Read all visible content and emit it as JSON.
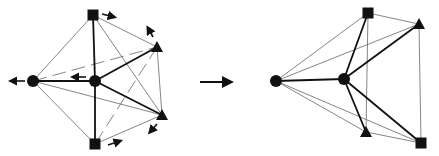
{
  "diagram": {
    "colors": {
      "ink": "#111111",
      "thin_edge": "#777777",
      "background": "#ffffff"
    },
    "left_graph": {
      "nodes": [
        {
          "id": "sq_top",
          "shape": "square",
          "x": 93,
          "y": 15
        },
        {
          "id": "tri_right",
          "shape": "triangle",
          "x": 157,
          "y": 47
        },
        {
          "id": "circle_left",
          "shape": "circle",
          "x": 33,
          "y": 81
        },
        {
          "id": "circle_center",
          "shape": "circle",
          "x": 95,
          "y": 81
        },
        {
          "id": "tri_bottom",
          "shape": "triangle",
          "x": 162,
          "y": 115
        },
        {
          "id": "sq_bottom",
          "shape": "square",
          "x": 95,
          "y": 144
        }
      ],
      "motion_arrows": [
        {
          "x1": 102,
          "y1": 14,
          "x2": 114,
          "y2": 17
        },
        {
          "x1": 153,
          "y1": 37,
          "x2": 148,
          "y2": 28
        },
        {
          "x1": 25,
          "y1": 81,
          "x2": 11,
          "y2": 81
        },
        {
          "x1": 86,
          "y1": 77,
          "x2": 73,
          "y2": 77
        },
        {
          "x1": 157,
          "y1": 124,
          "x2": 150,
          "y2": 132
        },
        {
          "x1": 108,
          "y1": 145,
          "x2": 120,
          "y2": 141
        }
      ]
    },
    "transition_arrow": {
      "x1": 200,
      "y1": 82,
      "x2": 234,
      "y2": 82
    },
    "right_graph": {
      "nodes": [
        {
          "id": "sq_top",
          "shape": "square",
          "x": 368,
          "y": 13
        },
        {
          "id": "tri_right",
          "shape": "triangle",
          "x": 419,
          "y": 24
        },
        {
          "id": "circle_left",
          "shape": "circle",
          "x": 276,
          "y": 81
        },
        {
          "id": "circle_center",
          "shape": "circle",
          "x": 344,
          "y": 79
        },
        {
          "id": "tri_bottom",
          "shape": "triangle",
          "x": 366,
          "y": 132
        },
        {
          "id": "sq_bottom",
          "shape": "square",
          "x": 421,
          "y": 143
        }
      ]
    }
  }
}
